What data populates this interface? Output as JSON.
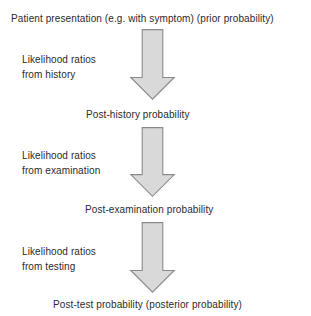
{
  "diagram": {
    "background_color": "#ffffff",
    "text_color": "#2b2b2b",
    "arrow_fill_color": "#d9d9d9",
    "arrow_border_color": "#8a8a8a",
    "stages": [
      {
        "id": "prior",
        "label": "Patient presentation (e.g. with symptom) (prior probability)"
      },
      {
        "id": "post-history",
        "label": "Post-history probability"
      },
      {
        "id": "post-examination",
        "label": "Post-examination probability"
      },
      {
        "id": "posterior",
        "label": "Post-test probability (posterior probability)"
      }
    ],
    "notes": [
      {
        "id": "history",
        "line1": "Likelihood ratios",
        "line2": "from history"
      },
      {
        "id": "examination",
        "line1": "Likelihood ratios",
        "line2": "from examination"
      },
      {
        "id": "testing",
        "line1": "Likelihood ratios",
        "line2": "from testing"
      }
    ],
    "arrows": [
      {
        "id": "arrow-history",
        "direction": "down"
      },
      {
        "id": "arrow-examination",
        "direction": "down"
      },
      {
        "id": "arrow-testing",
        "direction": "down"
      }
    ]
  }
}
